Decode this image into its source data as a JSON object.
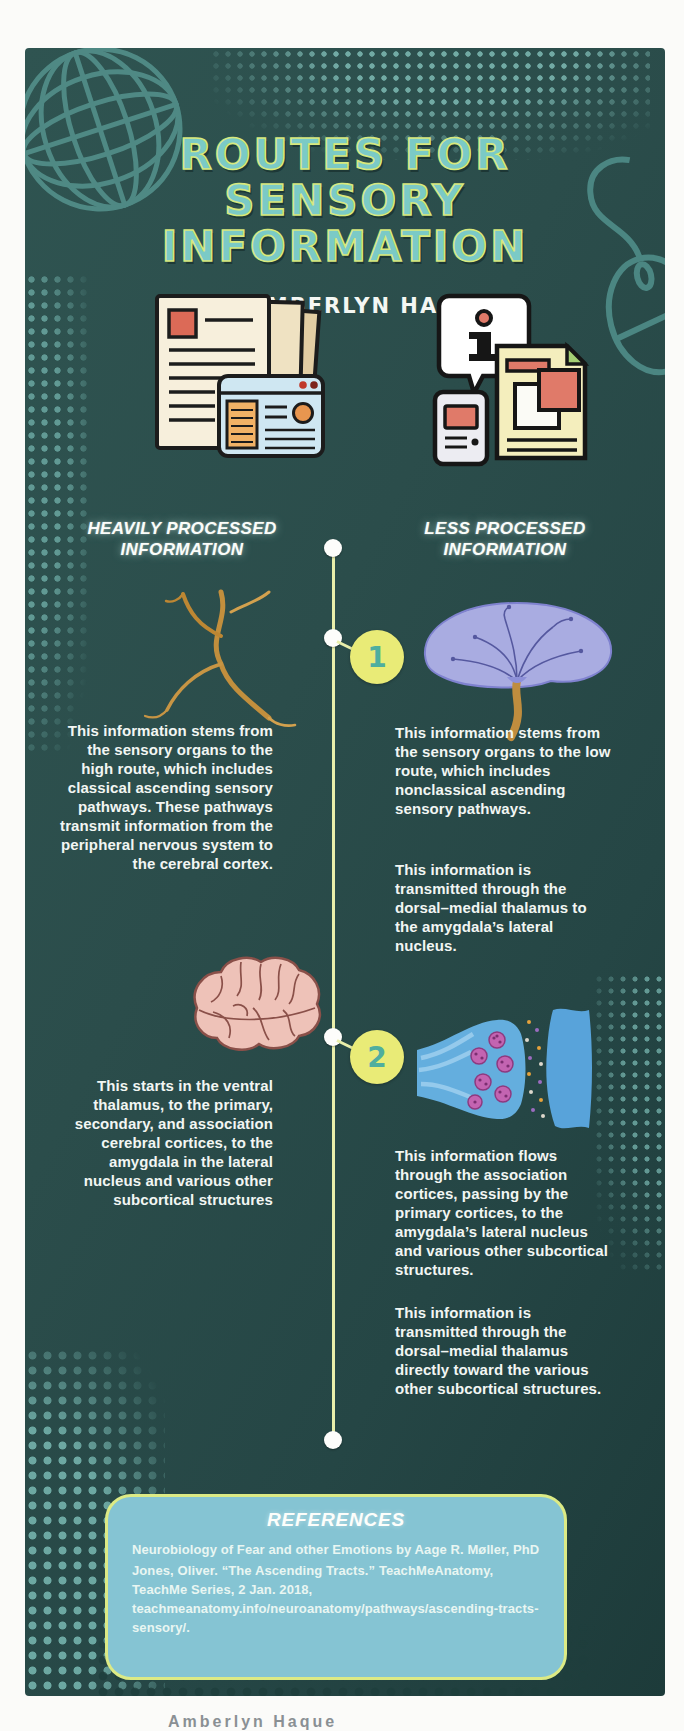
{
  "poster": {
    "bg_color": "#2a4b49",
    "title_fill_color": "#7bcac6",
    "title_outline_color": "#d7e87d",
    "title_lines": [
      "ROUTES FOR",
      "SENSORY",
      "INFORMATION"
    ],
    "byline": "BY: AMBERLYN HAQUE"
  },
  "columns": {
    "left": {
      "label": "HEAVILY PROCESSED INFORMATION",
      "para1": "This information stems from the sensory organs to the high route, which includes classical ascending sensory pathways. These pathways transmit information from the peripheral nervous system to the cerebral cortex.",
      "para2": "This starts in the ventral thalamus, to the primary, secondary, and association cerebral cortices, to the amygdala in the lateral nucleus and various other subcortical structures"
    },
    "right": {
      "label": "LESS PROCESSED INFORMATION",
      "para1a": "This information stems from the sensory organs to the low route, which includes nonclassical ascending sensory pathways.",
      "para1b": "This information is transmitted through the dorsal–medial thalamus to the amygdala’s lateral nucleus.",
      "para2a": "This information flows through the association cortices, passing by the primary cortices, to the amygdala’s lateral nucleus and various other subcortical structures.",
      "para2b": "This information is transmitted through the dorsal–medial thalamus directly toward the various other subcortical structures."
    }
  },
  "timeline": {
    "step1_label": "1",
    "step2_label": "2",
    "line_color": "#e9efab",
    "badge_color": "#e9eb77",
    "badge_number_color": "#4fae9f"
  },
  "references": {
    "heading": "REFERENCES",
    "entries": [
      "Neurobiology of Fear and other Emotions by Aage R. Møller, PhD",
      "Jones, Oliver. “The Ascending Tracts.” TeachMeAnatomy, TeachMe Series, 2 Jan. 2018, teachmeanatomy.info/neuroanatomy/pathways/ascending-tracts-sensory/."
    ],
    "box_color": "#85c4d3",
    "border_color": "#dcea85"
  },
  "footer": {
    "cropped_caption": "Amberlyn Haque"
  },
  "icons": {
    "top_left": "globe-wireframe-icon",
    "right_side": "computer-mouse-icon",
    "left_media": "stacked-documents-browser-icon",
    "right_media": "info-bubble-documents-icon",
    "left_step1": "axon-branches-illustration",
    "right_step1": "dendrite-tree-illustration",
    "left_step2": "brain-illustration",
    "right_step2": "synapse-illustration"
  }
}
